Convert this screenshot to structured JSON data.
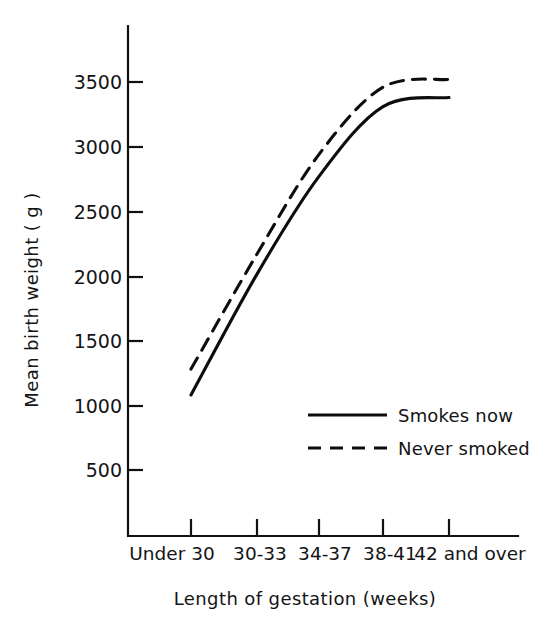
{
  "chart_data": {
    "type": "line",
    "title": "",
    "xlabel": "Length of gestation (weeks)",
    "ylabel": "Mean birth weight ( g )",
    "categories": [
      "Under 30",
      "30-33",
      "34-37",
      "38-41",
      "42 and over"
    ],
    "series": [
      {
        "name": "Smokes now",
        "style": "solid",
        "values": [
          1080,
          2015,
          2770,
          3310,
          3380
        ]
      },
      {
        "name": "Never smoked",
        "style": "dashed",
        "values": [
          1280,
          2170,
          2940,
          3460,
          3520
        ]
      }
    ],
    "ylim": [
      0,
      3750
    ],
    "yticks": [
      500,
      1000,
      1500,
      2000,
      2500,
      3000,
      3500
    ],
    "ytick_labels": [
      "500",
      "1000",
      "1500",
      "2000",
      "2500",
      "3000",
      "3500"
    ],
    "grid": false,
    "legend_position": "inside-lower-right",
    "line_color": "#0d0d0d",
    "background_color": "#ffffff"
  },
  "axes": {
    "y_title": "Mean birth weight ( g )",
    "x_title": "Length of gestation (weeks)",
    "y_ticks": [
      {
        "label": "3500",
        "value": 3500
      },
      {
        "label": "3000",
        "value": 3000
      },
      {
        "label": "2500",
        "value": 2500
      },
      {
        "label": "2000",
        "value": 2000
      },
      {
        "label": "1500",
        "value": 1500
      },
      {
        "label": "1000",
        "value": 1000
      },
      {
        "label": "500",
        "value": 500
      }
    ],
    "x_ticks": [
      {
        "label": "Under 30"
      },
      {
        "label": "30-33"
      },
      {
        "label": "34-37"
      },
      {
        "label": "38-41"
      },
      {
        "label": "42 and over"
      }
    ]
  },
  "legend": {
    "entries": [
      {
        "label": "Smokes now",
        "style": "solid"
      },
      {
        "label": "Never smoked",
        "style": "dashed"
      }
    ]
  }
}
